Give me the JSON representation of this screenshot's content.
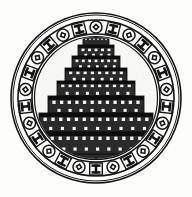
{
  "artwork": {
    "title": "Ziggurat Medallion Emblem",
    "subject": "ziggurat-tower",
    "style": "black-and-white engraving",
    "canvas": {
      "width": 192,
      "height": 197
    },
    "background_color": "#fdfdfb",
    "ink_color": "#151515",
    "tone_color": "#2e2e2e",
    "highlight_color": "#f2f1ec"
  },
  "medallion": {
    "name": "circular decorative border",
    "center_x": 96,
    "center_y": 98,
    "outer_radius": 85,
    "outer_rim_radius": 83,
    "band_outer_radius": 78,
    "band_inner_radius": 64,
    "inner_rim_radius": 61.5,
    "ring_stroke_color": "#151515",
    "ring_fill_color": "#fdfdfb",
    "motif_count": 26,
    "motif_sequence": [
      "diamond-in-circle",
      "bar-block"
    ],
    "motif_labels": {
      "diamond": "diamond-in-circle-motif",
      "bar": "bar-block-motif"
    }
  },
  "tower": {
    "name": "ziggurat tower",
    "tier_count": 7,
    "base_y": 170,
    "center_x": 96,
    "body_color": "#2a2a2a",
    "edge_color": "#111111",
    "niche_color": "#f2f1ec",
    "tiers": [
      {
        "index": 1,
        "label": "tier-1-top",
        "half_width": 18,
        "top": 45,
        "height": 11,
        "lip_height": 3,
        "niches": 5,
        "dots": 4,
        "dot_rows": 1
      },
      {
        "index": 2,
        "label": "tier-2",
        "half_width": 24,
        "top": 56,
        "height": 12,
        "lip_height": 3,
        "niches": 7,
        "dots": 5,
        "dot_rows": 1
      },
      {
        "index": 3,
        "label": "tier-3",
        "half_width": 31,
        "top": 68,
        "height": 13,
        "lip_height": 3,
        "niches": 8,
        "dots": 6,
        "dot_rows": 1
      },
      {
        "index": 4,
        "label": "tier-4",
        "half_width": 39,
        "top": 81,
        "height": 15,
        "lip_height": 3,
        "niches": 10,
        "dots": 7,
        "dot_rows": 1
      },
      {
        "index": 5,
        "label": "tier-5",
        "half_width": 48,
        "top": 96,
        "height": 17,
        "lip_height": 4,
        "niches": 12,
        "dots": 8,
        "dot_rows": 1
      },
      {
        "index": 6,
        "label": "tier-6",
        "half_width": 57,
        "top": 113,
        "height": 19,
        "lip_height": 4,
        "niches": 14,
        "dots": 9,
        "dot_rows": 1
      },
      {
        "index": 7,
        "label": "tier-7-base",
        "half_width": 66,
        "top": 132,
        "height": 22,
        "lip_height": 4,
        "niches": 16,
        "dots": 11,
        "dot_rows": 1
      }
    ],
    "shrine": {
      "label": "crenellated-shrine",
      "half_width": 13,
      "top": 34,
      "height": 11,
      "merlon_count": 7,
      "merlon_height": 3
    },
    "plinth": {
      "label": "base-plinth",
      "half_width": 71,
      "top": 154,
      "height": 9
    }
  }
}
